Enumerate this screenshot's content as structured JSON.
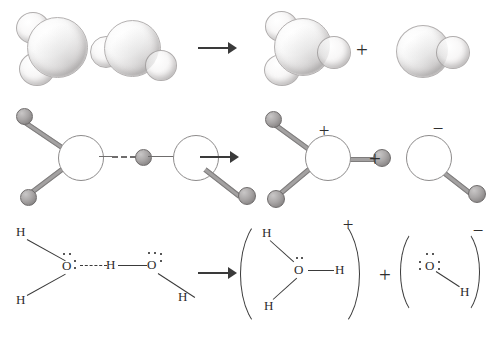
{
  "figure": {
    "reaction": "2 H2O -> H3O+ + OH-",
    "rows": [
      {
        "id": "space-filling",
        "label": "space-filling models"
      },
      {
        "id": "ball-and-stick",
        "label": "ball-and-stick models"
      },
      {
        "id": "lewis",
        "label": "Lewis structures"
      }
    ]
  },
  "symbols": {
    "plus": "+",
    "minus": "−",
    "arrow": "→"
  },
  "row1": {
    "reactant_1": {
      "name": "water-molecule",
      "atoms": [
        "O",
        "H",
        "H"
      ]
    },
    "reactant_2": {
      "name": "water-molecule",
      "atoms": [
        "O",
        "H",
        "H"
      ]
    },
    "operator_arrow": "→",
    "product_1": {
      "name": "hydronium-ion",
      "atoms": [
        "O",
        "H",
        "H",
        "H"
      ]
    },
    "operator_plus": "+",
    "product_2": {
      "name": "hydroxide-ion",
      "atoms": [
        "O",
        "H"
      ]
    }
  },
  "row2": {
    "reactant_1": {
      "name": "water-molecule",
      "atoms": [
        "O",
        "H",
        "H"
      ]
    },
    "reactant_2": {
      "name": "water-molecule",
      "atoms": [
        "O",
        "H"
      ]
    },
    "operator_arrow": "→",
    "product_1": {
      "name": "hydronium-ion",
      "charge": "+"
    },
    "operator_plus": "+",
    "product_2": {
      "name": "hydroxide-ion",
      "charge": "−"
    }
  },
  "row3": {
    "reactant_1": {
      "name": "water-lewis",
      "center": "O",
      "hydrogens": [
        "H",
        "H"
      ],
      "lone_pairs": 2
    },
    "hydrogen_bond_label": "hydrogen-bond",
    "reactant_2": {
      "name": "water-lewis",
      "center": "O",
      "hydrogens": [
        "H",
        "H"
      ],
      "lone_pairs": 2
    },
    "operator_arrow": "→",
    "product_1": {
      "name": "hydronium-lewis",
      "center": "O",
      "hydrogens": [
        "H",
        "H",
        "H"
      ],
      "lone_pairs": 1,
      "charge": "+"
    },
    "operator_plus": "+",
    "product_2": {
      "name": "hydroxide-lewis",
      "center": "O",
      "hydrogens": [
        "H"
      ],
      "lone_pairs": 3,
      "charge": "−"
    }
  },
  "labels": {
    "H": "H",
    "O": "O"
  },
  "colors": {
    "ink": "#2b2b2b",
    "line": "#3a3a3a",
    "sphere_outline": "#b4b1b1",
    "hydrogen_ball": "#8a8787",
    "background": "#ffffff"
  }
}
